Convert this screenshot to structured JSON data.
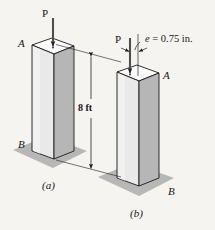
{
  "figure": {
    "kind": "engineering-illustration",
    "background_color": "#f6f4f0",
    "ink_color": "#161616"
  },
  "colors": {
    "face_left": "#e9e9e9",
    "face_right": "#b6b6b6",
    "face_top": "#fbfbfb",
    "ground_shadow": "#b3b3b3",
    "outline": "#1a1a1a",
    "arrow": "#2a2a2a"
  },
  "subfigures": [
    {
      "id": "a",
      "caption": "(a)",
      "load_label": "P",
      "top_point_label": "A",
      "bottom_point_label": "B",
      "load_type": "concentric"
    },
    {
      "id": "b",
      "caption": "(b)",
      "load_label": "P",
      "top_point_label": "A",
      "bottom_point_label": "B",
      "load_type": "eccentric",
      "eccentricity_label": "e = 0.75 in.",
      "eccentricity_symbol": "e",
      "eccentricity_equals": "=",
      "eccentricity_value": "0.75 in."
    }
  ],
  "dimension": {
    "label": "8 ft",
    "value": "8",
    "unit": "ft",
    "orientation": "vertical",
    "arrowheads": "both"
  }
}
